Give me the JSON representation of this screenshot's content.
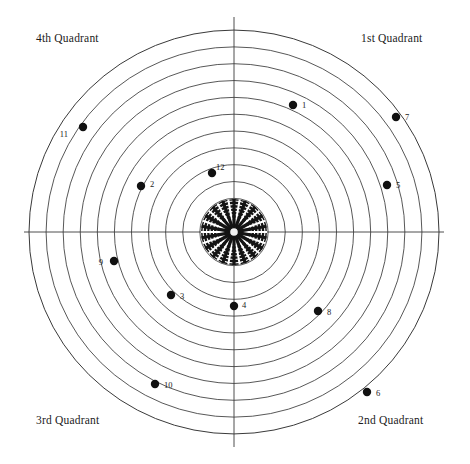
{
  "figure": {
    "type": "polar-scatter",
    "background_color": "#ffffff",
    "line_color": "#3a3a3a",
    "point_color": "#111111",
    "center": {
      "x": 234,
      "y": 232
    },
    "outer_radius": 205,
    "ring_count": 12,
    "axes": [
      "horizontal",
      "vertical"
    ]
  },
  "quadrant_labels": {
    "first": "1st Quadrant",
    "second": "2nd Quadrant",
    "third": "3rd Quadrant",
    "fourth": "4th Quadrant"
  },
  "hub": {
    "name": "radial-rosette-hub",
    "radius": 33,
    "spokes": 18,
    "rings": 9
  },
  "chart_data": {
    "type": "scatter",
    "title": "",
    "xlabel": "",
    "ylabel": "",
    "coordinate_system": "polar",
    "grid": true,
    "ring_count": 12,
    "legend_position": "none",
    "annotations": [
      "1st Quadrant",
      "2nd Quadrant",
      "3rd Quadrant",
      "4th Quadrant"
    ],
    "points": [
      {
        "label": "1",
        "x": 293,
        "y": 105,
        "lx": 302,
        "ly": 105,
        "r_px": 135,
        "angle_deg": 69,
        "quadrant": "1st"
      },
      {
        "label": "2",
        "x": 141,
        "y": 186,
        "lx": 150,
        "ly": 184,
        "r_px": 101,
        "angle_deg": 153,
        "quadrant": "4th"
      },
      {
        "label": "3",
        "x": 171,
        "y": 295,
        "lx": 180,
        "ly": 296,
        "r_px": 95,
        "angle_deg": 227,
        "quadrant": "3rd"
      },
      {
        "label": "4",
        "x": 234,
        "y": 306,
        "lx": 242,
        "ly": 305,
        "r_px": 74,
        "angle_deg": 270,
        "quadrant": "3rd"
      },
      {
        "label": "5",
        "x": 387,
        "y": 185,
        "lx": 396,
        "ly": 185,
        "r_px": 157,
        "angle_deg": 17,
        "quadrant": "1st"
      },
      {
        "label": "6",
        "x": 367,
        "y": 392,
        "lx": 376,
        "ly": 393,
        "r_px": 207,
        "angle_deg": 310,
        "quadrant": "2nd"
      },
      {
        "label": "7",
        "x": 396,
        "y": 117,
        "lx": 405,
        "ly": 117,
        "r_px": 199,
        "angle_deg": 35,
        "quadrant": "1st"
      },
      {
        "label": "8",
        "x": 318,
        "y": 311,
        "lx": 327,
        "ly": 312,
        "r_px": 117,
        "angle_deg": 317,
        "quadrant": "2nd"
      },
      {
        "label": "9",
        "x": 114,
        "y": 261,
        "lx": 103,
        "ly": 262,
        "r_px": 123,
        "angle_deg": 194,
        "quadrant": "3rd"
      },
      {
        "label": "10",
        "x": 155,
        "y": 384,
        "lx": 164,
        "ly": 385,
        "r_px": 178,
        "angle_deg": 241,
        "quadrant": "3rd"
      },
      {
        "label": "11",
        "x": 83,
        "y": 127,
        "lx": 68,
        "ly": 134,
        "r_px": 185,
        "angle_deg": 144,
        "quadrant": "4th"
      },
      {
        "label": "12",
        "x": 212,
        "y": 173,
        "lx": 216,
        "ly": 167,
        "r_px": 62,
        "angle_deg": 110,
        "quadrant": "4th"
      }
    ]
  }
}
